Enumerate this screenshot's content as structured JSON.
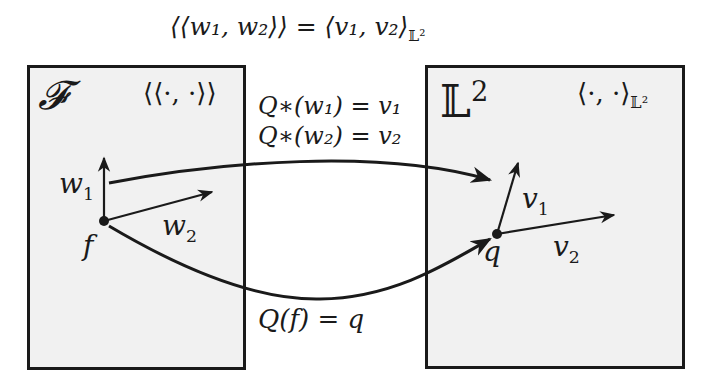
{
  "top_equation": "⟨⟨w₁, w₂⟩⟩ = ⟨v₁, v₂⟩",
  "top_equation_sub": "𝕃²",
  "spaces": {
    "source": {
      "symbol": "𝓕",
      "inner_product": "⟨⟨·, ·⟩⟩",
      "point": "f",
      "vectors": [
        "w",
        "w"
      ],
      "vector_indices": [
        "1",
        "2"
      ]
    },
    "target": {
      "symbol": "𝕃",
      "symbol_sup": "2",
      "inner_product": "⟨·, ·⟩",
      "inner_product_sub": "𝕃²",
      "point": "q",
      "vectors": [
        "v",
        "v"
      ],
      "vector_indices": [
        "1",
        "2"
      ]
    }
  },
  "mappings": {
    "pushforward_1": "Q∗(w₁) = v₁",
    "pushforward_2": "Q∗(w₂) = v₂",
    "point_map": "Q(f) = q"
  },
  "colors": {
    "box_fill": "#f1f1f1",
    "stroke": "#1a1a1a",
    "background": "#ffffff"
  }
}
